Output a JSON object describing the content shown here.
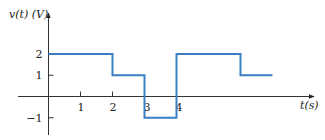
{
  "chart_data": {
    "type": "line",
    "style": "step",
    "title": "",
    "xlabel": "t(s)",
    "ylabel": "v(t) (V)",
    "x_ticks": [
      "1",
      "2",
      "3",
      "4"
    ],
    "y_ticks": [
      "2",
      "1",
      "−1"
    ],
    "xlim": [
      -1,
      8.5
    ],
    "ylim": [
      -1.5,
      3.2
    ],
    "grid": false,
    "legend": null,
    "series": [
      {
        "name": "v(t)",
        "color": "#3a7fc1",
        "segments": [
          {
            "t_start": 0,
            "t_end": 2,
            "value": 2
          },
          {
            "t_start": 2,
            "t_end": 3,
            "value": 1
          },
          {
            "t_start": 3,
            "t_end": 4,
            "value": -1
          },
          {
            "t_start": 4,
            "t_end": 6,
            "value": 2
          },
          {
            "t_start": 6,
            "t_end": 7,
            "value": 1
          }
        ],
        "x": [
          0,
          2,
          2,
          3,
          3,
          4,
          4,
          6,
          6,
          7
        ],
        "y": [
          2,
          2,
          1,
          1,
          -1,
          -1,
          2,
          2,
          1,
          1
        ]
      }
    ]
  }
}
